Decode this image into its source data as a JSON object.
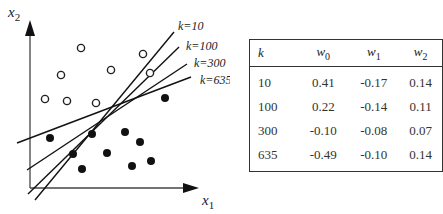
{
  "figure": {
    "axes": {
      "x_label": "x",
      "x_sub": "1",
      "y_label": "x",
      "y_sub": "2"
    },
    "open_points": [
      [
        81,
        48
      ],
      [
        61,
        75
      ],
      [
        111,
        70
      ],
      [
        143,
        54
      ],
      [
        150,
        73
      ],
      [
        45,
        99
      ],
      [
        67,
        101
      ],
      [
        96,
        103
      ]
    ],
    "filled_points": [
      [
        165,
        98
      ],
      [
        50,
        138
      ],
      [
        92,
        134
      ],
      [
        125,
        132
      ],
      [
        140,
        142
      ],
      [
        73,
        154
      ],
      [
        107,
        153
      ],
      [
        151,
        161
      ],
      [
        82,
        169
      ],
      [
        132,
        166
      ]
    ],
    "lines": [
      {
        "label": "k=10",
        "x1": 35,
        "y1": 200,
        "x2": 174,
        "y2": 32,
        "lx": 178,
        "ly": 30
      },
      {
        "label": "k=100",
        "x1": 28,
        "y1": 194,
        "x2": 179,
        "y2": 47,
        "lx": 186,
        "ly": 50
      },
      {
        "label": "k=300",
        "x1": 27,
        "y1": 170,
        "x2": 187,
        "y2": 64,
        "lx": 194,
        "ly": 67
      },
      {
        "label": "k=635",
        "x1": 17,
        "y1": 143,
        "x2": 191,
        "y2": 77,
        "lx": 200,
        "ly": 84
      }
    ]
  },
  "table": {
    "headers": [
      {
        "main": "k",
        "sub": ""
      },
      {
        "main": "w",
        "sub": "0"
      },
      {
        "main": "w",
        "sub": "1"
      },
      {
        "main": "w",
        "sub": "2"
      }
    ],
    "rows": [
      [
        "10",
        "0.41",
        "-0.17",
        "0.14"
      ],
      [
        "100",
        "0.22",
        "-0.14",
        "0.11"
      ],
      [
        "300",
        "-0.10",
        "-0.08",
        "0.07"
      ],
      [
        "635",
        "-0.49",
        "-0.10",
        "0.14"
      ]
    ]
  }
}
